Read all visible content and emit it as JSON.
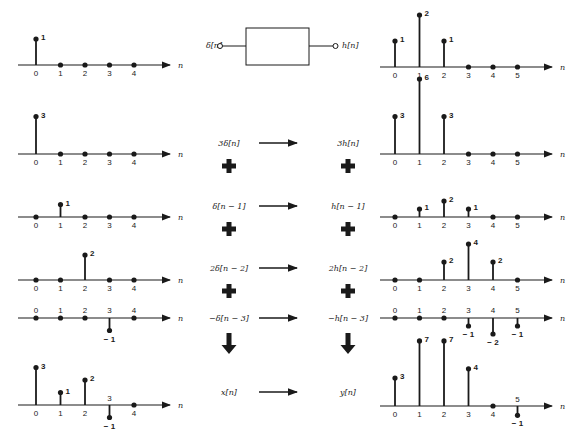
{
  "system": {
    "input_label": "δ[n]",
    "output_label": "h[n]"
  },
  "axis_label": "n",
  "colors": {
    "ink": "#1a1a1a",
    "background": "#ffffff"
  },
  "rows": [
    {
      "name": "impulse-response-definition",
      "expr_in": "δ[n]",
      "expr_out": "h[n]",
      "operator": "system-box"
    },
    {
      "name": "term-1",
      "expr_in": "3δ[n]",
      "expr_out": "3h[n]",
      "operator": "plus"
    },
    {
      "name": "term-2",
      "expr_in": "δ[n − 1]",
      "expr_out": "h[n − 1]",
      "operator": "plus"
    },
    {
      "name": "term-3",
      "expr_in": "2δ[n − 2]",
      "expr_out": "2h[n − 2]",
      "operator": "plus"
    },
    {
      "name": "term-4",
      "expr_in": "−δ[n − 3]",
      "expr_out": "−h[n − 3]",
      "operator": "down-arrow"
    },
    {
      "name": "sum",
      "expr_in": "x[n]",
      "expr_out": "y[n]",
      "operator": "none"
    }
  ],
  "chart_data": [
    {
      "type": "stem",
      "title": "δ[n]",
      "x": [
        0,
        1,
        2,
        3,
        4
      ],
      "values": [
        1,
        0,
        0,
        0,
        0
      ],
      "xlabel": "n"
    },
    {
      "type": "stem",
      "title": "h[n]",
      "x": [
        0,
        1,
        2,
        3,
        4,
        5
      ],
      "values": [
        1,
        2,
        1,
        0,
        0,
        0
      ],
      "xlabel": "n"
    },
    {
      "type": "stem",
      "title": "3δ[n]",
      "x": [
        0,
        1,
        2,
        3,
        4
      ],
      "values": [
        3,
        0,
        0,
        0,
        0
      ],
      "xlabel": "n"
    },
    {
      "type": "stem",
      "title": "3h[n]",
      "x": [
        0,
        1,
        2,
        3,
        4,
        5
      ],
      "values": [
        3,
        6,
        3,
        0,
        0,
        0
      ],
      "xlabel": "n"
    },
    {
      "type": "stem",
      "title": "δ[n − 1]",
      "x": [
        0,
        1,
        2,
        3,
        4
      ],
      "values": [
        0,
        1,
        0,
        0,
        0
      ],
      "xlabel": "n"
    },
    {
      "type": "stem",
      "title": "h[n − 1]",
      "x": [
        0,
        1,
        2,
        3,
        4,
        5
      ],
      "values": [
        0,
        1,
        2,
        1,
        0,
        0
      ],
      "xlabel": "n"
    },
    {
      "type": "stem",
      "title": "2δ[n − 2]",
      "x": [
        0,
        1,
        2,
        3,
        4
      ],
      "values": [
        0,
        0,
        2,
        0,
        0
      ],
      "xlabel": "n"
    },
    {
      "type": "stem",
      "title": "2h[n − 2]",
      "x": [
        0,
        1,
        2,
        3,
        4,
        5
      ],
      "values": [
        0,
        0,
        2,
        4,
        2,
        0
      ],
      "xlabel": "n"
    },
    {
      "type": "stem",
      "title": "−δ[n − 3]",
      "x": [
        0,
        1,
        2,
        3,
        4
      ],
      "values": [
        0,
        0,
        0,
        -1,
        0
      ],
      "xlabel": "n"
    },
    {
      "type": "stem",
      "title": "−h[n − 3]",
      "x": [
        0,
        1,
        2,
        3,
        4,
        5
      ],
      "values": [
        0,
        0,
        0,
        -1,
        -2,
        -1
      ],
      "xlabel": "n"
    },
    {
      "type": "stem",
      "title": "x[n]",
      "x": [
        0,
        1,
        2,
        3,
        4
      ],
      "values": [
        3,
        1,
        2,
        -1,
        0
      ],
      "xlabel": "n"
    },
    {
      "type": "stem",
      "title": "y[n]",
      "x": [
        0,
        1,
        2,
        3,
        4,
        5
      ],
      "values": [
        3,
        7,
        7,
        4,
        0,
        -1
      ],
      "xlabel": "n"
    }
  ]
}
